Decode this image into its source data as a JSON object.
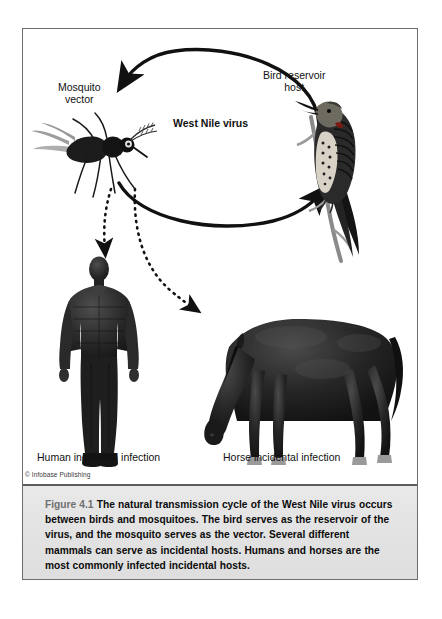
{
  "figure": {
    "frame_border_color": "#6d6d6d",
    "caption_bg": "#e6e6e6",
    "caption": {
      "number": "Figure 4.1",
      "text": "The natural transmission cycle of the West Nile virus occurs between birds and mosquitoes. The bird serves as the reservoir of the virus, and the mosquito serves as the vector. Several different mammals can serve as incidental hosts. Humans and horses are the most commonly infected incidental hosts."
    },
    "copyright": "© Infobase Publishing"
  },
  "diagram": {
    "type": "transmission-cycle",
    "center_label": "West Nile virus",
    "nodes": [
      {
        "id": "mosquito",
        "label_line1": "Mosquito",
        "label_line2": "vector",
        "icon": "mosquito-illustration"
      },
      {
        "id": "bird",
        "label_line1": "Bird reservoir",
        "label_line2": "host",
        "icon": "bird-illustration"
      },
      {
        "id": "human",
        "label": "Human incidental infection",
        "icon": "human-silhouette"
      },
      {
        "id": "horse",
        "label": "Horse incidental infection",
        "icon": "horse-silhouette"
      }
    ],
    "arrows": [
      {
        "id": "bird-to-mosquito",
        "style": "solid",
        "from": "bird",
        "to": "mosquito"
      },
      {
        "id": "mosquito-to-bird",
        "style": "solid",
        "from": "mosquito",
        "to": "bird"
      },
      {
        "id": "mosquito-to-human",
        "style": "dashed",
        "from": "mosquito",
        "to": "human"
      },
      {
        "id": "mosquito-to-horse",
        "style": "dashed",
        "from": "mosquito",
        "to": "horse"
      }
    ],
    "arrow_color": "#111111"
  }
}
